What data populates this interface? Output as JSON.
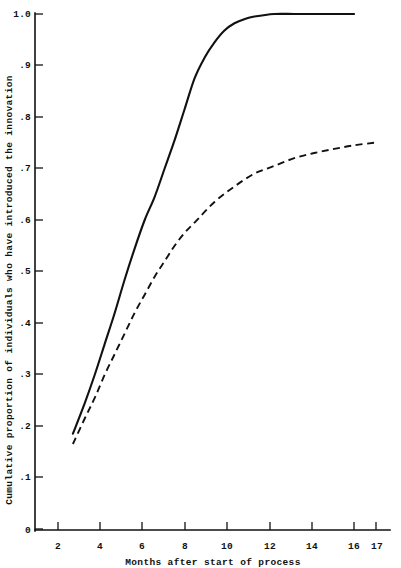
{
  "chart_data": {
    "type": "line",
    "title": "",
    "xlabel": "Months after start of process",
    "ylabel": "Cumulative proportion of individuals who have introduced the innovation",
    "xlim": [
      0,
      17.8
    ],
    "ylim": [
      0,
      1.0
    ],
    "grid": false,
    "legend_position": "none",
    "x_ticks": [
      2,
      4,
      6,
      8,
      10,
      12,
      14,
      16,
      17
    ],
    "x_tick_labels": [
      "2",
      "4",
      "6",
      "8",
      "10",
      "12",
      "14",
      "16",
      "17"
    ],
    "y_ticks": [
      0,
      0.1,
      0.2,
      0.3,
      0.4,
      0.5,
      0.6,
      0.7,
      0.8,
      0.9,
      1.0
    ],
    "y_tick_labels": [
      "0",
      ".1",
      ".2",
      ".3",
      ".4",
      ".5",
      ".6",
      ".7",
      ".8",
      ".9",
      "1.0"
    ],
    "series": [
      {
        "name": "solid-curve",
        "style": "solid",
        "color": "#111111",
        "x": [
          1.9,
          2.5,
          3.0,
          3.5,
          4.0,
          4.5,
          5.0,
          5.5,
          6.0,
          6.5,
          7.0,
          7.5,
          8.0,
          8.5,
          9.0,
          9.5,
          10.0,
          10.5,
          11.0,
          12.0,
          13.0,
          14.0,
          15.0,
          16.0
        ],
        "y": [
          0.185,
          0.245,
          0.3,
          0.36,
          0.42,
          0.485,
          0.545,
          0.6,
          0.645,
          0.7,
          0.755,
          0.815,
          0.875,
          0.915,
          0.945,
          0.968,
          0.982,
          0.99,
          0.995,
          1.0,
          1.0,
          1.0,
          1.0,
          1.0
        ]
      },
      {
        "name": "dashed-curve",
        "style": "dashed",
        "color": "#111111",
        "x": [
          1.9,
          2.5,
          3.0,
          3.5,
          4.0,
          4.5,
          5.0,
          5.5,
          6.0,
          6.5,
          7.0,
          7.5,
          8.0,
          9.0,
          10.0,
          11.0,
          12.0,
          13.0,
          14.0,
          15.0,
          16.0,
          17.0
        ],
        "y": [
          0.165,
          0.215,
          0.255,
          0.3,
          0.34,
          0.38,
          0.42,
          0.455,
          0.49,
          0.52,
          0.55,
          0.575,
          0.595,
          0.635,
          0.665,
          0.69,
          0.705,
          0.72,
          0.73,
          0.738,
          0.745,
          0.75
        ]
      }
    ]
  },
  "axis": {
    "x_label": "Months after start of process",
    "y_label": "Cumulative proportion of individuals who have introduced the innovation"
  },
  "ticks": {
    "y": {
      "t10": "1.0",
      "t09": ".9",
      "t08": ".8",
      "t07": ".7",
      "t06": ".6",
      "t05": ".5",
      "t04": ".4",
      "t03": ".3",
      "t02": ".2",
      "t01": ".1",
      "t00": "0"
    },
    "x": {
      "t2": "2",
      "t4": "4",
      "t6": "6",
      "t8": "8",
      "t10": "10",
      "t12": "12",
      "t14": "14",
      "t16": "16",
      "t17": "17"
    }
  }
}
